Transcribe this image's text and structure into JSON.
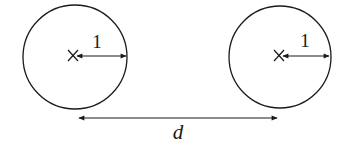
{
  "diagram": {
    "circles": [
      {
        "id": "left",
        "cx": 75,
        "cy": 57,
        "r": 52,
        "radius_label": "1"
      },
      {
        "id": "right",
        "cx": 280,
        "cy": 57,
        "r": 51,
        "radius_label": "1"
      }
    ],
    "distance_label": "d",
    "colors": {
      "stroke": "#1a1a1a",
      "background": "#ffffff"
    }
  }
}
